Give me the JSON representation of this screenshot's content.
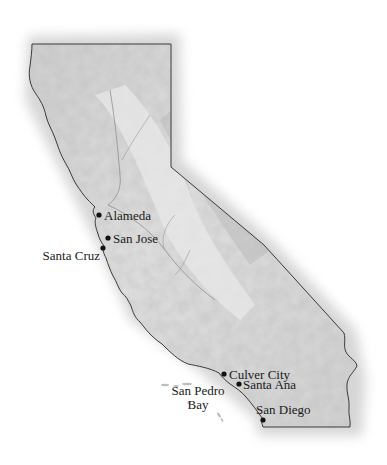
{
  "map": {
    "region": "California",
    "style": "shaded relief",
    "colors": {
      "land": "#d6d6d6",
      "relief_dark": "#a8a8a8",
      "border": "#3a3a3a",
      "water_bg": "#ffffff",
      "label": "#1a1a1a",
      "marker": "#111111"
    },
    "cities": [
      {
        "name": "Alameda",
        "marker": true
      },
      {
        "name": "San Jose",
        "marker": true
      },
      {
        "name": "Santa Cruz",
        "marker": true
      },
      {
        "name": "Culver City",
        "marker": true
      },
      {
        "name": "Santa Ana",
        "marker": true
      },
      {
        "name": "San Diego",
        "marker": true
      }
    ],
    "water_labels": [
      {
        "line1": "San Pedro",
        "line2": "Bay"
      }
    ]
  }
}
